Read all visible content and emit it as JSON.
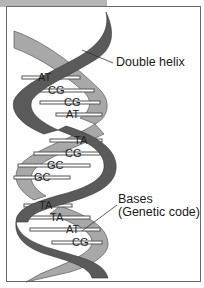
{
  "figure": {
    "labels": {
      "helix": "Double helix",
      "bases_line1": "Bases",
      "bases_line2": "(Genetic code)"
    },
    "base_pairs": [
      {
        "text": "AT",
        "x": 38,
        "y": 81
      },
      {
        "text": "CG",
        "x": 48,
        "y": 94
      },
      {
        "text": "CG",
        "x": 64,
        "y": 106
      },
      {
        "text": "AT",
        "x": 66,
        "y": 118
      },
      {
        "text": "TA",
        "x": 74,
        "y": 144
      },
      {
        "text": "CG",
        "x": 65,
        "y": 157
      },
      {
        "text": "GC",
        "x": 47,
        "y": 169
      },
      {
        "text": "GC",
        "x": 34,
        "y": 181
      },
      {
        "text": "TA",
        "x": 39,
        "y": 209
      },
      {
        "text": "TA",
        "x": 50,
        "y": 221
      },
      {
        "text": "AT",
        "x": 66,
        "y": 233
      },
      {
        "text": "CG",
        "x": 72,
        "y": 246
      }
    ],
    "colors": {
      "dark_strand": "#5a5a5a",
      "light_strand": "#a8a8a8",
      "frame": "#6a6a6a",
      "tab": "#b5b5b5"
    }
  }
}
